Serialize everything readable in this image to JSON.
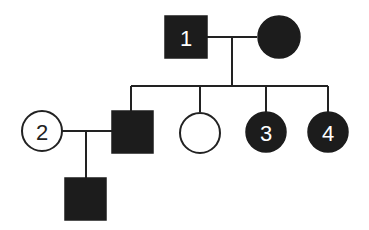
{
  "diagram": {
    "type": "pedigree",
    "colors": {
      "affected": "#1c1c1c",
      "unaffected": "#ffffff",
      "line": "#222222",
      "background": "#ffffff"
    },
    "individuals": [
      {
        "id": "gen1-father",
        "label": "1",
        "sex": "male",
        "affected": true,
        "generation": 1
      },
      {
        "id": "gen1-mother",
        "label": "",
        "sex": "female",
        "affected": true,
        "generation": 1
      },
      {
        "id": "gen2-spouse",
        "label": "2",
        "sex": "female",
        "affected": false,
        "generation": 2
      },
      {
        "id": "gen2-son",
        "label": "",
        "sex": "male",
        "affected": true,
        "generation": 2
      },
      {
        "id": "gen2-daughter-a",
        "label": "",
        "sex": "female",
        "affected": false,
        "generation": 2
      },
      {
        "id": "gen2-daughter-b",
        "label": "3",
        "sex": "female",
        "affected": true,
        "generation": 2
      },
      {
        "id": "gen2-daughter-c",
        "label": "4",
        "sex": "female",
        "affected": true,
        "generation": 2
      },
      {
        "id": "gen3-son",
        "label": "",
        "sex": "male",
        "affected": true,
        "generation": 3
      }
    ],
    "labels": {
      "p1": "1",
      "p2": "2",
      "p3": "3",
      "p4": "4"
    }
  }
}
